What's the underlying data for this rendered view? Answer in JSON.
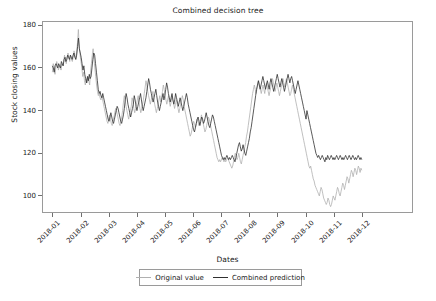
{
  "chart_data": {
    "type": "line",
    "title": "Combined decision tree",
    "xlabel": "Dates",
    "ylabel": "Stock closing values",
    "grid": false,
    "legend_position": "bottom-center",
    "ylim": [
      92,
      182
    ],
    "yticks": [
      100,
      120,
      140,
      160,
      180
    ],
    "xlim": [
      "2018-01",
      "2018-12"
    ],
    "xticks": [
      "2018-01",
      "2018-02",
      "2018-03",
      "2018-04",
      "2018-05",
      "2018-06",
      "2018-07",
      "2018-08",
      "2018-09",
      "2018-10",
      "2018-11",
      "2018-12"
    ],
    "x_start_fraction": 0.028,
    "x_end_fraction": 0.862,
    "series": [
      {
        "name": "Original value",
        "color": "#b0b0b0",
        "values": [
          158,
          162,
          160,
          157,
          160,
          163,
          161,
          159,
          161,
          160,
          159,
          162,
          161,
          163,
          166,
          164,
          162,
          165,
          167,
          165,
          163,
          166,
          164,
          163,
          165,
          168,
          166,
          164,
          167,
          172,
          178,
          170,
          166,
          163,
          160,
          156,
          158,
          154,
          152,
          155,
          153,
          156,
          154,
          152,
          158,
          162,
          166,
          169,
          164,
          160,
          156,
          152,
          149,
          147,
          148,
          146,
          145,
          147,
          145,
          143,
          141,
          139,
          137,
          135,
          134,
          136,
          138,
          136,
          134,
          133,
          135,
          137,
          139,
          141,
          140,
          138,
          136,
          134,
          133,
          135,
          137,
          140,
          144,
          147,
          145,
          142,
          140,
          138,
          136,
          138,
          140,
          142,
          146,
          144,
          141,
          139,
          141,
          143,
          145,
          147,
          144,
          141,
          139,
          141,
          143,
          145,
          148,
          151,
          154,
          152,
          149,
          147,
          145,
          143,
          145,
          147,
          149,
          146,
          143,
          141,
          139,
          141,
          143,
          145,
          147,
          144,
          146,
          149,
          152,
          150,
          147,
          145,
          143,
          145,
          147,
          144,
          142,
          144,
          147,
          145,
          143,
          141,
          143,
          145,
          143,
          141,
          139,
          141,
          143,
          145,
          147,
          145,
          142,
          140,
          138,
          136,
          134,
          132,
          130,
          128,
          129,
          131,
          133,
          135,
          134,
          132,
          134,
          136,
          135,
          133,
          134,
          136,
          138,
          136,
          134,
          132,
          130,
          131,
          133,
          135,
          137,
          136,
          134,
          132,
          130,
          128,
          126,
          124,
          122,
          120,
          118,
          117,
          116,
          117,
          116,
          117,
          118,
          117,
          116,
          117,
          116,
          117,
          118,
          117,
          116,
          115,
          114,
          113,
          114,
          116,
          118,
          120,
          119,
          117,
          118,
          120,
          118,
          116,
          115,
          117,
          119,
          121,
          123,
          125,
          128,
          130,
          133,
          136,
          139,
          142,
          145,
          148,
          150,
          152,
          150,
          148,
          150,
          152,
          154,
          152,
          150,
          148,
          150,
          152,
          150,
          148,
          151,
          153,
          151,
          149,
          147,
          149,
          151,
          153,
          155,
          153,
          151,
          149,
          151,
          153,
          151,
          149,
          147,
          149,
          151,
          153,
          155,
          153,
          151,
          153,
          155,
          153,
          151,
          149,
          147,
          148,
          150,
          152,
          150,
          148,
          146,
          144,
          142,
          140,
          138,
          136,
          134,
          132,
          130,
          128,
          126,
          124,
          122,
          120,
          118,
          116,
          114,
          113,
          114,
          112,
          110,
          108,
          107,
          105,
          104,
          103,
          102,
          101,
          100,
          102,
          104,
          103,
          101,
          99,
          98,
          97,
          96,
          97,
          99,
          98,
          96,
          95,
          96,
          98,
          100,
          99,
          98,
          100,
          102,
          104,
          103,
          101,
          100,
          102,
          104,
          106,
          105,
          103,
          105,
          107,
          109,
          108,
          106,
          108,
          110,
          112,
          111,
          109,
          111,
          113,
          112,
          110,
          112,
          114,
          113,
          111,
          113,
          112
        ]
      },
      {
        "name": "Combined prediction",
        "color": "#303030",
        "values": [
          161,
          160,
          158,
          161,
          162,
          161,
          160,
          162,
          161,
          160,
          163,
          162,
          161,
          164,
          165,
          163,
          164,
          166,
          165,
          164,
          166,
          165,
          164,
          166,
          167,
          165,
          164,
          166,
          170,
          174,
          169,
          167,
          165,
          162,
          159,
          161,
          157,
          155,
          153,
          156,
          154,
          157,
          155,
          156,
          160,
          164,
          167,
          166,
          162,
          158,
          154,
          150,
          148,
          149,
          147,
          146,
          148,
          146,
          144,
          142,
          140,
          138,
          136,
          135,
          137,
          139,
          137,
          135,
          134,
          136,
          138,
          140,
          142,
          141,
          139,
          137,
          135,
          134,
          136,
          138,
          141,
          145,
          148,
          146,
          143,
          141,
          139,
          137,
          139,
          141,
          143,
          147,
          145,
          142,
          140,
          142,
          144,
          146,
          148,
          145,
          142,
          140,
          142,
          144,
          146,
          149,
          152,
          155,
          153,
          150,
          148,
          146,
          144,
          146,
          148,
          150,
          147,
          144,
          142,
          140,
          142,
          144,
          146,
          148,
          145,
          147,
          150,
          153,
          151,
          148,
          146,
          144,
          146,
          148,
          145,
          143,
          145,
          148,
          146,
          144,
          142,
          144,
          146,
          144,
          142,
          140,
          142,
          144,
          146,
          148,
          146,
          143,
          141,
          139,
          137,
          135,
          133,
          131,
          130,
          132,
          134,
          136,
          137,
          135,
          133,
          135,
          137,
          136,
          134,
          135,
          137,
          139,
          137,
          135,
          133,
          132,
          134,
          136,
          138,
          137,
          135,
          133,
          131,
          129,
          127,
          125,
          123,
          121,
          119,
          118,
          117,
          118,
          117,
          118,
          119,
          118,
          117,
          118,
          117,
          118,
          119,
          118,
          117,
          116,
          118,
          120,
          122,
          124,
          125,
          123,
          121,
          122,
          124,
          122,
          120,
          119,
          121,
          123,
          125,
          127,
          130,
          132,
          135,
          138,
          141,
          144,
          147,
          150,
          152,
          154,
          152,
          150,
          152,
          154,
          156,
          154,
          152,
          150,
          152,
          154,
          152,
          150,
          153,
          155,
          153,
          151,
          149,
          151,
          153,
          155,
          157,
          155,
          153,
          151,
          153,
          155,
          153,
          151,
          149,
          151,
          153,
          155,
          157,
          155,
          153,
          155,
          156,
          154,
          152,
          150,
          148,
          150,
          152,
          154,
          152,
          150,
          148,
          146,
          144,
          142,
          140,
          138,
          136,
          140,
          138,
          136,
          134,
          132,
          130,
          128,
          126,
          124,
          122,
          120,
          119,
          118,
          119,
          118,
          117,
          118,
          119,
          118,
          117,
          116,
          118,
          117,
          119,
          118,
          117,
          118,
          119,
          118,
          117,
          118,
          117,
          118,
          119,
          118,
          117,
          118,
          119,
          118,
          117,
          118,
          117,
          118,
          119,
          118,
          117,
          118,
          119,
          118,
          117,
          118,
          119,
          118,
          117,
          118,
          117,
          118,
          119,
          118,
          117,
          118,
          117
        ]
      }
    ]
  }
}
